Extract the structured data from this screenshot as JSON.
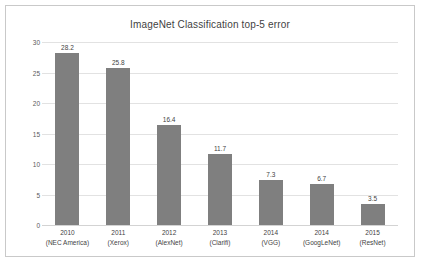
{
  "chart_data": {
    "type": "bar",
    "title": "ImageNet Classification top-5 error",
    "xlabel": "",
    "ylabel": "",
    "ylim": [
      0,
      30
    ],
    "ytick_step": 5,
    "yticks": [
      "0",
      "5",
      "10",
      "15",
      "20",
      "25",
      "30"
    ],
    "grid": true,
    "legend": "none",
    "bar_color": "#7f7f7f",
    "gridline_color": "#e2e2e2",
    "categories": [
      "2010\n(NEC America)",
      "2011\n(Xerox)",
      "2012\n(AlexNet)",
      "2013\n(Clarifi)",
      "2014\n(VGG)",
      "2014\n(GoogLeNet)",
      "2015\n(ResNet)"
    ],
    "values": [
      28.2,
      25.8,
      16.4,
      11.7,
      7.3,
      6.7,
      3.5
    ],
    "value_labels": [
      "28.2",
      "25.8",
      "16.4",
      "11.7",
      "7.3",
      "6.7",
      "3.5"
    ],
    "bars": [
      {
        "year": "2010",
        "team": "(NEC America)",
        "value": 28.2,
        "label": "28.2"
      },
      {
        "year": "2011",
        "team": "(Xerox)",
        "value": 25.8,
        "label": "25.8"
      },
      {
        "year": "2012",
        "team": "(AlexNet)",
        "value": 16.4,
        "label": "16.4"
      },
      {
        "year": "2013",
        "team": "(Clarifi)",
        "value": 11.7,
        "label": "11.7"
      },
      {
        "year": "2014",
        "team": "(VGG)",
        "value": 7.3,
        "label": "7.3"
      },
      {
        "year": "2014",
        "team": "(GoogLeNet)",
        "value": 6.7,
        "label": "6.7"
      },
      {
        "year": "2015",
        "team": "(ResNet)",
        "value": 3.5,
        "label": "3.5"
      }
    ]
  }
}
